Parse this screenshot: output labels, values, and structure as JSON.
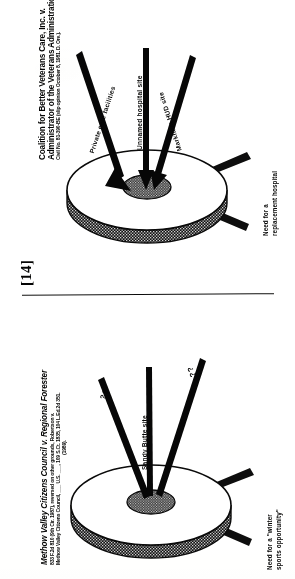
{
  "page": {
    "marker": "[14]",
    "background_color": "#fdfdfc",
    "ink_color": "#0b0b0b",
    "orientation": "text rotated 90 degrees counter-clockwise (sideways scan)"
  },
  "separator": {
    "name": "horizontal-rule"
  },
  "figures": [
    {
      "id": "figure-top",
      "case_title_line_1": "Coalition for Better Veterans Care, Inc. v.",
      "case_title_line_2": "Administrator of the Veterans Administration",
      "case_title_italic_1": "for Better Veterans Care, Inc. v.",
      "case_title_italic_2": "of the Veterans Administration",
      "citation": "Civil No. 81-390-BE (slip opinion October 8, 1981. D. Ore.).",
      "arrows": [
        {
          "label": "Private care facilities",
          "name": "arrow-private-care-facilities"
        },
        {
          "label": "Unnamed hospital site",
          "name": "arrow-unnamed-hospital-site"
        },
        {
          "label": "Markham HUD site",
          "name": "arrow-markham-hud-site"
        }
      ],
      "side_label_line_1": "Need for a",
      "side_label_line_2": "replacement hospital",
      "disc": {
        "name": "cone-disc-diagram",
        "rim_fill": "#1a1a1a",
        "top_fill": "#ffffff",
        "inner_fill": "#3a3a3a"
      }
    },
    {
      "id": "figure-bottom",
      "case_title_line_1": "Methow Valley Citizens Council v. Regional Forester",
      "case_title_italic_1": "Methow Valley Citizens Council v. Regional Forester",
      "citation_line_1": "833 F.2d 810 (9th Cir. 1987), reversed on other grounds, Robertson v.",
      "citation_line_2": "Methow Valley Citizens Council, ___ U.S. ___, 109 S.Ct. 1835, 104 L.Ed.2d 351.",
      "citation_line_3": "(1989).",
      "arrows": [
        {
          "label": "??",
          "name": "arrow-question-left"
        },
        {
          "label": "Sandy Butte site",
          "name": "arrow-sandy-butte-site"
        },
        {
          "label": "??",
          "name": "arrow-question-right"
        }
      ],
      "side_label_line_1": "Need for a \"winter",
      "side_label_line_2": "sports opportunity\"",
      "disc": {
        "name": "cone-disc-diagram",
        "rim_fill": "#1a1a1a",
        "top_fill": "#ffffff",
        "inner_fill": "#3a3a3a"
      }
    }
  ]
}
